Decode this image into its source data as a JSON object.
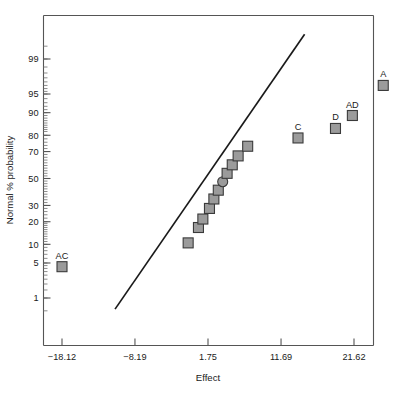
{
  "chart_data": {
    "type": "scatter",
    "title": "",
    "xlabel": "Effect",
    "ylabel": "Normal % probability",
    "grid": false,
    "legend": null,
    "y_scale": "normal-probability",
    "xlim": [
      -18.12,
      21.62
    ],
    "x_ticks": [
      {
        "label": "−18.12",
        "value": -18.12
      },
      {
        "label": "−8.19",
        "value": -8.19
      },
      {
        "label": "1.75",
        "value": 1.75
      },
      {
        "label": "11.69",
        "value": 11.69
      },
      {
        "label": "21.62",
        "value": 21.62
      }
    ],
    "y_ticks": [
      {
        "label": "99",
        "value": 99
      },
      {
        "label": "95",
        "value": 95
      },
      {
        "label": "90",
        "value": 90
      },
      {
        "label": "80",
        "value": 80
      },
      {
        "label": "70",
        "value": 70
      },
      {
        "label": "50",
        "value": 50
      },
      {
        "label": "30",
        "value": 30
      },
      {
        "label": "20",
        "value": 20
      },
      {
        "label": "10",
        "value": 10
      },
      {
        "label": "5",
        "value": 5
      },
      {
        "label": "1",
        "value": 1
      }
    ],
    "reference_line": {
      "x_start": -10.9,
      "y_start": 0.55,
      "x_end": 14.9,
      "y_end": 99.75
    },
    "points": [
      {
        "label": "AC",
        "x": -18.12,
        "y": 4.3,
        "marker": "square"
      },
      {
        "label": "",
        "x": -0.95,
        "y": 10.5,
        "marker": "square"
      },
      {
        "label": "",
        "x": 0.45,
        "y": 17.0,
        "marker": "square"
      },
      {
        "label": "",
        "x": 1.05,
        "y": 21.5,
        "marker": "square"
      },
      {
        "label": "",
        "x": 1.95,
        "y": 28.0,
        "marker": "square"
      },
      {
        "label": "",
        "x": 2.55,
        "y": 34.5,
        "marker": "square"
      },
      {
        "label": "",
        "x": 3.15,
        "y": 41.0,
        "marker": "square"
      },
      {
        "label": "",
        "x": 3.75,
        "y": 47.5,
        "marker": "circle"
      },
      {
        "label": "",
        "x": 4.35,
        "y": 54.0,
        "marker": "square"
      },
      {
        "label": "",
        "x": 5.05,
        "y": 60.5,
        "marker": "square"
      },
      {
        "label": "",
        "x": 5.85,
        "y": 67.0,
        "marker": "square"
      },
      {
        "label": "",
        "x": 7.15,
        "y": 73.5,
        "marker": "square"
      },
      {
        "label": "C",
        "x": 14.0,
        "y": 78.5,
        "marker": "square"
      },
      {
        "label": "D",
        "x": 19.1,
        "y": 83.5,
        "marker": "square"
      },
      {
        "label": "AD",
        "x": 21.4,
        "y": 89.0,
        "marker": "square"
      },
      {
        "label": "A",
        "x": 25.6,
        "y": 96.5,
        "marker": "square"
      }
    ]
  },
  "colors": {
    "marker_fill": "#9b9b9b",
    "marker_stroke": "#3a3a3a",
    "line": "#1a1a1a",
    "axis": "#555555",
    "text": "#1a1a1a",
    "background": "#ffffff"
  }
}
